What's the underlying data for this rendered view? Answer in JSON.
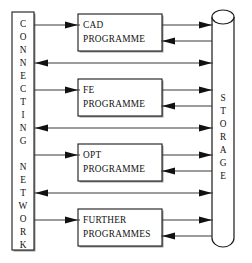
{
  "diagram": {
    "type": "block-flow-diagram",
    "background_color": "#ffffff",
    "line_color": "#3b3b3b",
    "outline_color": "#1a1a1a",
    "text_color": "#111111"
  },
  "network": {
    "name": "connecting-network",
    "shape": "vertical-rectangle",
    "label_lines": [
      "CONNECTING",
      "NETWORK"
    ],
    "letters": [
      "C",
      "O",
      "N",
      "N",
      "E",
      "C",
      "T",
      "I",
      "N",
      "G",
      "",
      "N",
      "E",
      "T",
      "W",
      "O",
      "R",
      "K"
    ]
  },
  "storage": {
    "name": "storage-cylinder",
    "shape": "cylinder",
    "label": "STORAGE",
    "letters": [
      "S",
      "T",
      "O",
      "R",
      "A",
      "G",
      "E"
    ]
  },
  "programmes": [
    {
      "id": "cad",
      "name": "cad-programme",
      "line1": "CAD",
      "line2": "PROGRAMME",
      "has_bypass_below": true
    },
    {
      "id": "fe",
      "name": "fe-programme",
      "line1": "FE",
      "line2": "PROGRAMME",
      "has_bypass_below": true
    },
    {
      "id": "opt",
      "name": "opt-programme",
      "line1": "OPT",
      "line2": "PROGRAMME",
      "has_bypass_below": true
    },
    {
      "id": "further",
      "name": "further-programmes",
      "line1": "FURTHER",
      "line2": "PROGRAMMES",
      "has_bypass_below": false
    }
  ],
  "connections": {
    "network_to_programme": "arrow pointing right into programme box",
    "programme_to_storage": "arrow pointing right into storage cylinder",
    "storage_to_programme": "arrow pointing left into programme box",
    "bypass": "bidirectional line between network and storage"
  }
}
